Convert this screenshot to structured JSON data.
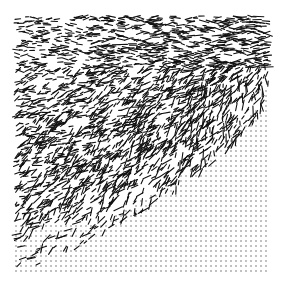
{
  "figure": {
    "background": "#ffffff",
    "ink": "#111111",
    "bounds": {
      "x0": 16,
      "y0": 16,
      "x1": 270,
      "y1": 272
    },
    "dot_grid": {
      "spacing": 5,
      "radius": 0.7,
      "color": "#555555"
    },
    "dash_field": {
      "count": 2600,
      "min_len": 3,
      "max_len": 11,
      "stroke": 1.1,
      "seed": 7
    }
  }
}
